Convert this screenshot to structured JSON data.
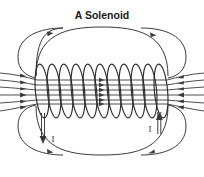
{
  "figure": {
    "title": "A Solenoid",
    "background_color": "#ffffff",
    "line_color": "#3a3a3a",
    "coil_color": "#2b2b2b",
    "text_color": "#1a1a1a",
    "width": 204,
    "height": 177
  },
  "diagram": {
    "type": "physics-field-diagram",
    "coil": {
      "turns": 11,
      "left_x": 36,
      "right_x": 166,
      "center_y": 91,
      "turn_ry": 27,
      "turn_rx": 6.5
    },
    "interior_field": {
      "direction": "left-to-right",
      "line_count": 6,
      "arrow_direction": "right"
    },
    "external_field": {
      "direction": "clockwise",
      "top_loop_arrows": "right",
      "bottom_loop_arrows": "right"
    },
    "leads": [
      {
        "name": "left-lead",
        "label": "I",
        "arrow_direction": "down",
        "x": 43,
        "label_x": 53,
        "label_y": 141
      },
      {
        "name": "right-lead",
        "label": "I",
        "arrow_direction": "up",
        "x": 159,
        "label_x": 150,
        "label_y": 131
      }
    ]
  },
  "labels": {
    "current_left": "I",
    "current_right": "I"
  }
}
